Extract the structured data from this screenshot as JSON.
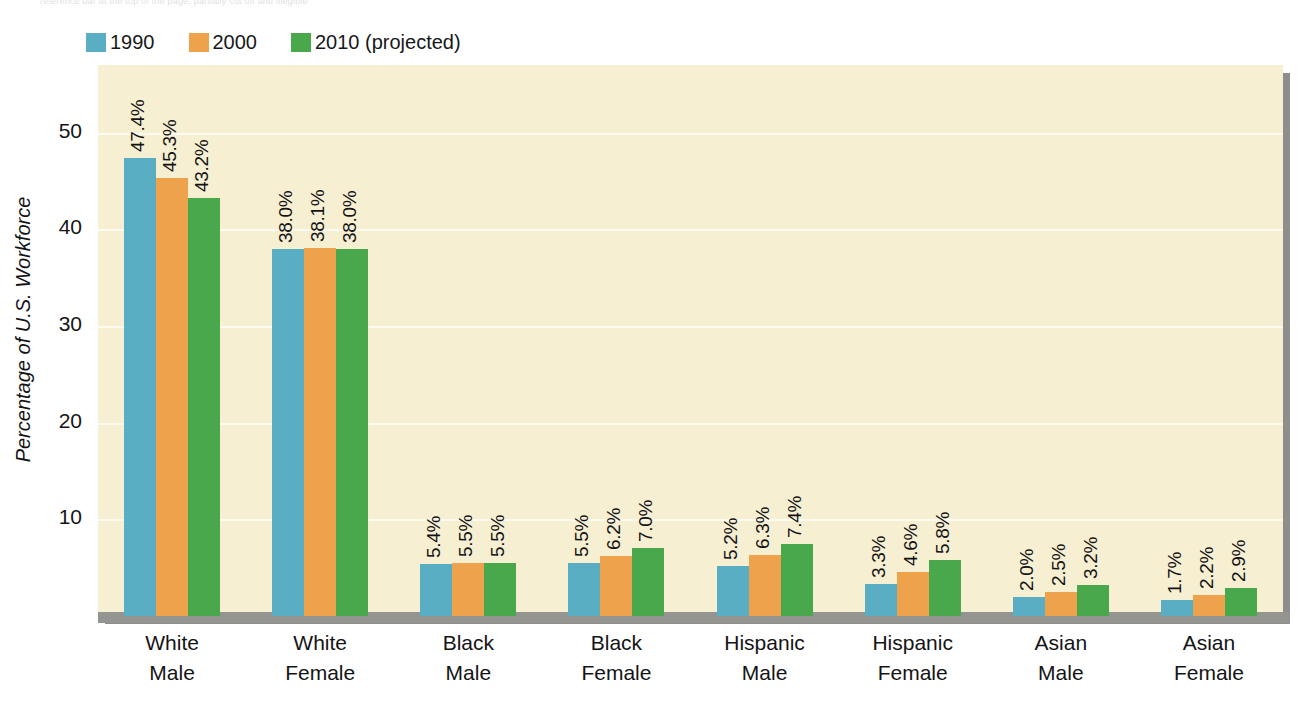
{
  "top_caption": "reference bar at the top of the page, partially cut off and illegible",
  "legend": {
    "position": "top-left",
    "items": [
      {
        "label": "1990",
        "color": "#5aaec4",
        "name": "legend-1990"
      },
      {
        "label": "2000",
        "color": "#efa24c",
        "name": "legend-2000"
      },
      {
        "label": "2010 (projected)",
        "color": "#49a84c",
        "name": "legend-2010"
      }
    ]
  },
  "colors": {
    "plot_background": "#f7efd2",
    "gridline": "#fdfaf0",
    "baseline": "#949490",
    "shadow": "#8e8e8a",
    "text": "#141416",
    "series_1990": "#5aaec4",
    "series_2000": "#efa24c",
    "series_2010": "#49a84c"
  },
  "chart_data": {
    "type": "bar",
    "title": "",
    "xlabel": "",
    "ylabel": "Percentage of U.S. Workforce",
    "ylim": [
      0,
      57
    ],
    "yticks": [
      10,
      20,
      30,
      40,
      50
    ],
    "ytick_labels": [
      "10",
      "20",
      "30",
      "40",
      "50"
    ],
    "grid": true,
    "legend_position": "top-left",
    "categories": [
      "White Male",
      "White Female",
      "Black Male",
      "Black Female",
      "Hispanic Male",
      "Hispanic Female",
      "Asian Male",
      "Asian Female"
    ],
    "category_lines": [
      [
        "White",
        "Male"
      ],
      [
        "White",
        "Female"
      ],
      [
        "Black",
        "Male"
      ],
      [
        "Black",
        "Female"
      ],
      [
        "Hispanic",
        "Male"
      ],
      [
        "Hispanic",
        "Female"
      ],
      [
        "Asian",
        "Male"
      ],
      [
        "Asian",
        "Female"
      ]
    ],
    "series": [
      {
        "name": "1990",
        "color": "#5aaec4",
        "values": [
          47.4,
          38.0,
          5.4,
          5.5,
          5.2,
          3.3,
          2.0,
          1.7
        ],
        "labels": [
          "47.4%",
          "38.0%",
          "5.4%",
          "5.5%",
          "5.2%",
          "3.3%",
          "2.0%",
          "1.7%"
        ]
      },
      {
        "name": "2000",
        "color": "#efa24c",
        "values": [
          45.3,
          38.1,
          5.5,
          6.2,
          6.3,
          4.6,
          2.5,
          2.2
        ],
        "labels": [
          "45.3%",
          "38.1%",
          "5.5%",
          "6.2%",
          "6.3%",
          "4.6%",
          "2.5%",
          "2.2%"
        ]
      },
      {
        "name": "2010 (projected)",
        "color": "#49a84c",
        "values": [
          43.2,
          38.0,
          5.5,
          7.0,
          7.4,
          5.8,
          3.2,
          2.9
        ],
        "labels": [
          "43.2%",
          "38.0%",
          "5.5%",
          "7.0%",
          "7.4%",
          "5.8%",
          "3.2%",
          "2.9%"
        ]
      }
    ]
  }
}
